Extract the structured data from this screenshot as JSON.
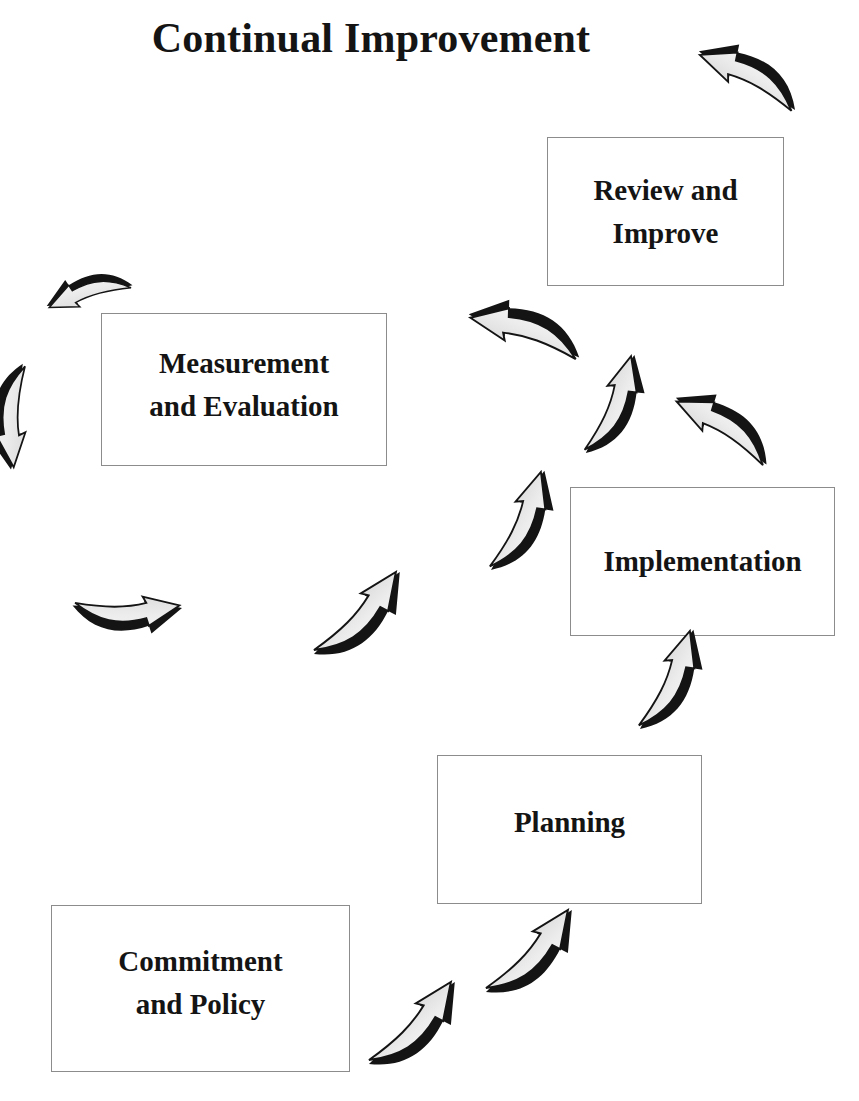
{
  "title": "Continual Improvement",
  "stages": [
    {
      "id": "commitment",
      "lines": [
        "Commitment",
        "and Policy"
      ]
    },
    {
      "id": "planning",
      "lines": [
        "Planning"
      ]
    },
    {
      "id": "implementation",
      "lines": [
        "Implementation"
      ]
    },
    {
      "id": "measurement",
      "lines": [
        "Measurement",
        "and Evaluation"
      ]
    },
    {
      "id": "review",
      "lines": [
        "Review and",
        "Improve"
      ]
    }
  ],
  "arrows": [
    {
      "name": "arrow-commitment-to-planning-1",
      "direction": "up-right"
    },
    {
      "name": "arrow-commitment-to-planning-2",
      "direction": "up-right"
    },
    {
      "name": "arrow-planning-to-implementation",
      "direction": "up-right"
    },
    {
      "name": "arrow-implementation-to-center",
      "direction": "up-left"
    },
    {
      "name": "arrow-center-to-review",
      "direction": "up-right"
    },
    {
      "name": "arrow-center-to-measurement",
      "direction": "left"
    },
    {
      "name": "arrow-loop-to-center",
      "direction": "up-right"
    },
    {
      "name": "arrow-measurement-loop-left",
      "direction": "left"
    },
    {
      "name": "arrow-measurement-loop-down",
      "direction": "down"
    },
    {
      "name": "arrow-measurement-loop-right",
      "direction": "right"
    },
    {
      "name": "arrow-measurement-loop-up-right",
      "direction": "up-right"
    },
    {
      "name": "arrow-review-continue",
      "direction": "up-left"
    }
  ],
  "colors": {
    "box_border": "#8c8c8c",
    "arrow_shadow": "#141414",
    "arrow_light": "#f4f4f4",
    "arrow_mid": "#c4c4c4",
    "text": "#141414"
  }
}
